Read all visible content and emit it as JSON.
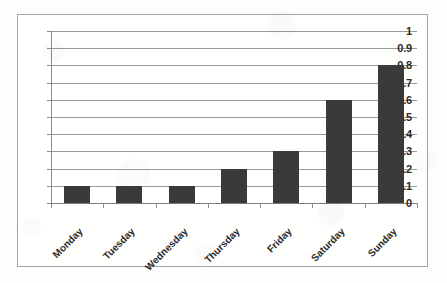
{
  "chart_data": {
    "type": "bar",
    "title": "",
    "subtitle": "",
    "xlabel": "",
    "ylabel": "",
    "categories": [
      "Monday",
      "Tuesday",
      "Wednesday",
      "Thursday",
      "Friday",
      "Saturday",
      "Sunday"
    ],
    "values": [
      0.1,
      0.1,
      0.1,
      0.2,
      0.3,
      0.6,
      0.8
    ],
    "ylim": [
      0,
      1
    ],
    "ytick_labels": [
      "1",
      "0.9",
      "0.8",
      "0.7",
      "0.6",
      "0.5",
      "0.4",
      "0.3",
      "0.2",
      "0.1",
      "0"
    ],
    "ytick_values": [
      1,
      0.9,
      0.8,
      0.7,
      0.6,
      0.5,
      0.4,
      0.3,
      0.2,
      0.1,
      0
    ],
    "ytick_step": 0.1,
    "grid": "horizontal",
    "legend": "none",
    "annotations": [],
    "series": [
      {
        "name": "",
        "values": [
          0.1,
          0.1,
          0.1,
          0.2,
          0.3,
          0.6,
          0.8
        ],
        "color": "#3A3A3A"
      }
    ]
  },
  "style": {
    "bar_color": "#3A3A3A",
    "gridline_color": "#9A9A9A",
    "axis_color": "#8C8C8C",
    "frame_color": "#A6A6A6",
    "text_color": "#2B2B2B",
    "plot_background": "#FFFFFD",
    "page_background": "#FDFDFB"
  }
}
